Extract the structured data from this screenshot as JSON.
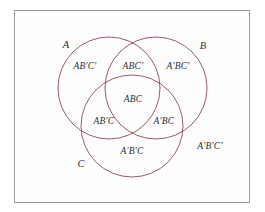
{
  "diagram": {
    "frame": {
      "border_color": "#9a9a9a",
      "background": "#fefefe"
    },
    "circle_color": "#8c4a52",
    "text_color": "#2b2b33",
    "set_labels": [
      {
        "name": "set-label-a",
        "text": "A",
        "x": 66,
        "y": 45
      },
      {
        "name": "set-label-b",
        "text": "B",
        "x": 203,
        "y": 46
      },
      {
        "name": "set-label-c",
        "text": "C",
        "x": 81,
        "y": 164
      }
    ],
    "circles": [
      {
        "name": "circle-a",
        "cx": 109,
        "cy": 88,
        "r": 51
      },
      {
        "name": "circle-b",
        "cx": 156,
        "cy": 88,
        "r": 51
      },
      {
        "name": "circle-c",
        "cx": 132,
        "cy": 126,
        "r": 51
      }
    ],
    "regions": [
      {
        "name": "region-a-only",
        "text": "AB′C′",
        "x": 85,
        "y": 67
      },
      {
        "name": "region-ab",
        "text": "ABC′",
        "x": 133,
        "y": 67
      },
      {
        "name": "region-b-only",
        "text": "A′BC′",
        "x": 178,
        "y": 67
      },
      {
        "name": "region-abc",
        "text": "ABC",
        "x": 133,
        "y": 100
      },
      {
        "name": "region-ac",
        "text": "AB′C",
        "x": 104,
        "y": 122
      },
      {
        "name": "region-bc",
        "text": "A′BC",
        "x": 164,
        "y": 122
      },
      {
        "name": "region-c-only",
        "text": "A′B′C",
        "x": 132,
        "y": 152
      },
      {
        "name": "region-outside",
        "text": "A′B′C′",
        "x": 210,
        "y": 147
      }
    ]
  }
}
